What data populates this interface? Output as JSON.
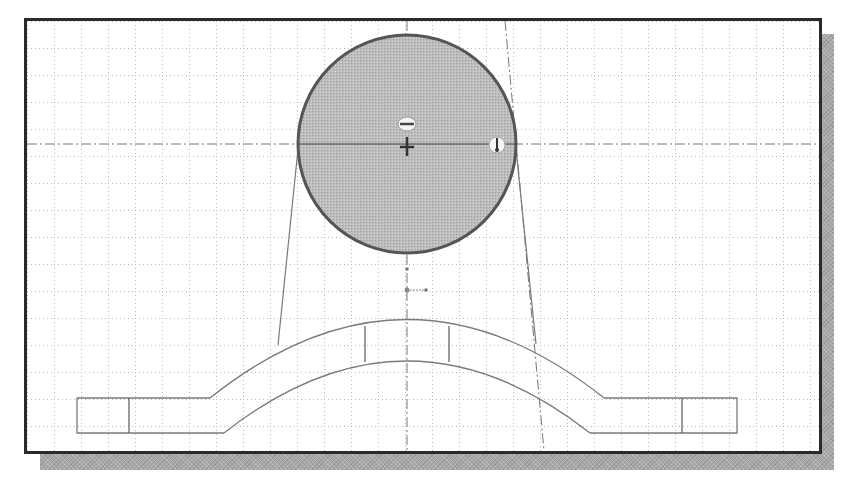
{
  "page": {
    "title_fragment": ""
  },
  "viewport": {
    "name": "sketch-graphics-area",
    "background_color": "#ffffff",
    "border_color": "#2a2a2a",
    "shadow_color": "#a9a9a9",
    "grid": {
      "visible": true,
      "style": "dotted",
      "spacing_px": 27,
      "color": "#b5b5b5"
    }
  },
  "sketch": {
    "entities": [
      {
        "type": "centerline-horizontal",
        "name": "horizontal-centerline",
        "style": "dash-dot"
      },
      {
        "type": "centerline-vertical",
        "name": "vertical-centerline",
        "style": "dash-dot"
      },
      {
        "type": "construction-line",
        "name": "inclined-construction-line",
        "style": "dash-dot"
      },
      {
        "type": "circle",
        "name": "selected-circle",
        "state": "selected",
        "fill_color": "#b3b3b3",
        "stroke_color": "#555555"
      },
      {
        "type": "line",
        "name": "left-tangent-line"
      },
      {
        "type": "line",
        "name": "right-tangent-line"
      },
      {
        "type": "arc",
        "name": "outer-arc"
      },
      {
        "type": "arc",
        "name": "inner-arc"
      },
      {
        "type": "rectangle",
        "name": "center-web"
      },
      {
        "type": "polyline",
        "name": "left-flange"
      },
      {
        "type": "polyline",
        "name": "right-flange"
      }
    ],
    "handles": [
      {
        "name": "center-drag-handle",
        "icon": "move-handle-icon"
      },
      {
        "name": "radius-drag-handle",
        "icon": "radius-handle-icon"
      }
    ],
    "selection_color": "#555555",
    "line_color": "#7a7a7a"
  }
}
